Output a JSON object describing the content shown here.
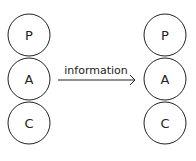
{
  "diagram": {
    "left_stack": {
      "nodes": [
        {
          "label": "P"
        },
        {
          "label": "A"
        },
        {
          "label": "C"
        }
      ]
    },
    "right_stack": {
      "nodes": [
        {
          "label": "P"
        },
        {
          "label": "A"
        },
        {
          "label": "C"
        }
      ]
    },
    "arrow": {
      "label": "information",
      "from": "left A",
      "to": "right A"
    },
    "colors": {
      "stroke": "#222222",
      "background": "#ffffff"
    }
  }
}
